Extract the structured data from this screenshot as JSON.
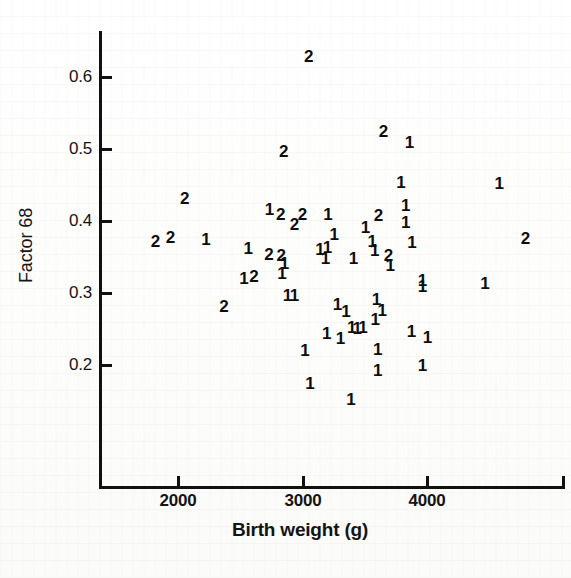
{
  "chart_data": {
    "type": "scatter",
    "title": "",
    "xlabel": "Birth weight (g)",
    "ylabel": "Factor 68",
    "xlim": [
      1450,
      4800
    ],
    "ylim": [
      0.14,
      0.645
    ],
    "xticks": [
      2000,
      3000,
      4000
    ],
    "xtick_labels": [
      "2000",
      "3000",
      "4000"
    ],
    "yticks": [
      0.2,
      0.3,
      0.4,
      0.5,
      0.6
    ],
    "ytick_labels": [
      "0.2",
      "0.3",
      "0.4",
      "0.5",
      "0.6"
    ],
    "grid": false,
    "legend": false,
    "marker_style": "group-number-glyph",
    "groups": [
      "1",
      "2"
    ],
    "points": [
      {
        "label": "2",
        "x": 3050,
        "y": 0.628
      },
      {
        "label": "2",
        "x": 3650,
        "y": 0.524
      },
      {
        "label": "1",
        "x": 3860,
        "y": 0.509
      },
      {
        "label": "2",
        "x": 2850,
        "y": 0.496
      },
      {
        "label": "1",
        "x": 3790,
        "y": 0.453
      },
      {
        "label": "4",
        "x": 4580,
        "y": 0.451,
        "label_text": "1"
      },
      {
        "label": "2",
        "x": 2055,
        "y": 0.43
      },
      {
        "label": "1",
        "x": 3830,
        "y": 0.421
      },
      {
        "label": "1",
        "x": 2735,
        "y": 0.415
      },
      {
        "label": "2",
        "x": 2825,
        "y": 0.409
      },
      {
        "label": "2",
        "x": 3000,
        "y": 0.408
      },
      {
        "label": "1",
        "x": 3205,
        "y": 0.408
      },
      {
        "label": "2",
        "x": 3610,
        "y": 0.407
      },
      {
        "label": "1",
        "x": 3830,
        "y": 0.397
      },
      {
        "label": "2",
        "x": 2935,
        "y": 0.395
      },
      {
        "label": "1",
        "x": 3505,
        "y": 0.39
      },
      {
        "label": "1",
        "x": 3255,
        "y": 0.381
      },
      {
        "label": "2",
        "x": 4790,
        "y": 0.375
      },
      {
        "label": "2",
        "x": 1820,
        "y": 0.371
      },
      {
        "label": "2",
        "x": 1940,
        "y": 0.376
      },
      {
        "label": "1",
        "x": 2225,
        "y": 0.374
      },
      {
        "label": "1",
        "x": 3560,
        "y": 0.371
      },
      {
        "label": "1",
        "x": 3880,
        "y": 0.369
      },
      {
        "label": "1",
        "x": 2565,
        "y": 0.361
      },
      {
        "label": "1",
        "x": 3140,
        "y": 0.36
      },
      {
        "label": "1",
        "x": 3200,
        "y": 0.363
      },
      {
        "label": "1",
        "x": 3580,
        "y": 0.358
      },
      {
        "label": "2",
        "x": 2730,
        "y": 0.353
      },
      {
        "label": "2",
        "x": 2830,
        "y": 0.352
      },
      {
        "label": "2",
        "x": 3690,
        "y": 0.351
      },
      {
        "label": "1",
        "x": 3185,
        "y": 0.347
      },
      {
        "label": "1",
        "x": 3410,
        "y": 0.347
      },
      {
        "label": "1",
        "x": 2855,
        "y": 0.341
      },
      {
        "label": "1",
        "x": 3705,
        "y": 0.337
      },
      {
        "label": "1",
        "x": 2835,
        "y": 0.327
      },
      {
        "label": "1",
        "x": 2530,
        "y": 0.32
      },
      {
        "label": "2",
        "x": 2610,
        "y": 0.322
      },
      {
        "label": "1",
        "x": 3965,
        "y": 0.317
      },
      {
        "label": "1",
        "x": 3965,
        "y": 0.308
      },
      {
        "label": "1",
        "x": 4465,
        "y": 0.312
      },
      {
        "label": "1",
        "x": 2880,
        "y": 0.296
      },
      {
        "label": "1",
        "x": 2935,
        "y": 0.296
      },
      {
        "label": "1",
        "x": 3595,
        "y": 0.291
      },
      {
        "label": "2",
        "x": 2370,
        "y": 0.281
      },
      {
        "label": "1",
        "x": 3280,
        "y": 0.283
      },
      {
        "label": "1",
        "x": 3350,
        "y": 0.273
      },
      {
        "label": "1",
        "x": 3640,
        "y": 0.275
      },
      {
        "label": "1",
        "x": 3585,
        "y": 0.263
      },
      {
        "label": "1",
        "x": 3395,
        "y": 0.252
      },
      {
        "label": "1",
        "x": 3440,
        "y": 0.25
      },
      {
        "label": "1",
        "x": 3485,
        "y": 0.252
      },
      {
        "label": "1",
        "x": 3195,
        "y": 0.243
      },
      {
        "label": "1",
        "x": 3875,
        "y": 0.246
      },
      {
        "label": "1",
        "x": 4005,
        "y": 0.238
      },
      {
        "label": "1",
        "x": 3305,
        "y": 0.236
      },
      {
        "label": "1",
        "x": 3020,
        "y": 0.219
      },
      {
        "label": "1",
        "x": 3605,
        "y": 0.221
      },
      {
        "label": "1",
        "x": 3965,
        "y": 0.199
      },
      {
        "label": "1",
        "x": 3605,
        "y": 0.192
      },
      {
        "label": "1",
        "x": 3060,
        "y": 0.174
      },
      {
        "label": "1",
        "x": 3390,
        "y": 0.152
      }
    ]
  },
  "axes": {
    "y_title": "Factor 68",
    "x_title": "Birth weight (g)"
  }
}
